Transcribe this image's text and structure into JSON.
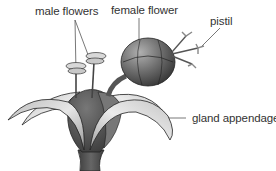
{
  "diagram": {
    "labels": {
      "male_flowers": "male flowers",
      "female_flower": "female flower",
      "pistil": "pistil",
      "gland_appendage": "gland appendage"
    },
    "colors": {
      "text": "#333333",
      "leader_line": "#555555",
      "outline": "#222222",
      "petal_light": "#d8d8d8",
      "petal_mid": "#a8a8a8",
      "body_dark": "#555555",
      "fruit_dark": "#4a4a4a"
    }
  }
}
